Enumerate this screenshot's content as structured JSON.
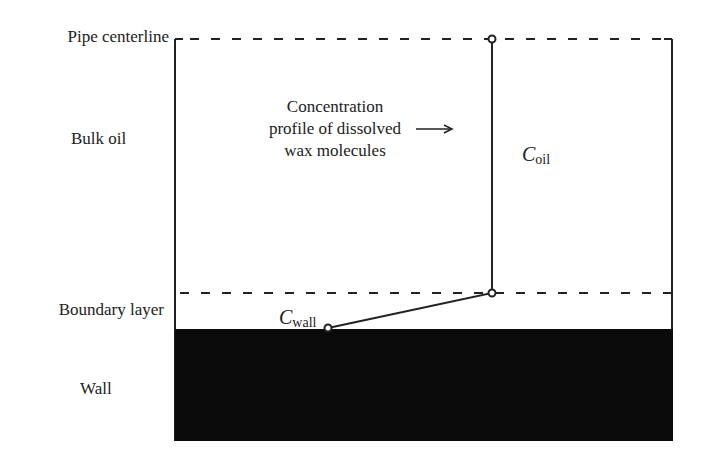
{
  "diagram": {
    "type": "wax-deposition-concentration-profile",
    "region_labels": {
      "pipe_centerline": "Pipe centerline",
      "bulk_oil": "Bulk oil",
      "boundary_layer": "Boundary layer",
      "wall": "Wall"
    },
    "annotation": {
      "line1": "Concentration",
      "line2": "profile of dissolved",
      "line3": "wax molecules"
    },
    "symbols": {
      "c_oil": {
        "main": "C",
        "sub": "oil"
      },
      "c_wall": {
        "main": "C",
        "sub": "wall"
      }
    },
    "colors": {
      "line": "#222222",
      "wall_fill": "#0a0a0a",
      "background": "#ffffff"
    },
    "profile_points": [
      {
        "name": "centerline-point",
        "x": 492,
        "y": 39
      },
      {
        "name": "boundary-point",
        "x": 492,
        "y": 293
      },
      {
        "name": "wall-point",
        "x": 328,
        "y": 328
      }
    ]
  }
}
